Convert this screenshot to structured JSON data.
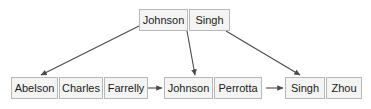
{
  "diagram": {
    "type": "hash-table-chaining-diagram",
    "root_node": {
      "name": "root-bucket-node",
      "x": 139,
      "y": 9,
      "cells": [
        {
          "label": "Johnson",
          "width": 49
        },
        {
          "label": "Singh",
          "width": 41
        }
      ]
    },
    "chain_nodes": [
      {
        "name": "chain-node-1",
        "x": 11,
        "y": 77,
        "cells": [
          {
            "label": "Abelson",
            "width": 47
          },
          {
            "label": "Charles",
            "width": 44
          },
          {
            "label": "Farrelly",
            "width": 44
          }
        ]
      },
      {
        "name": "chain-node-2",
        "x": 164,
        "y": 77,
        "cells": [
          {
            "label": "Johnson",
            "width": 49
          },
          {
            "label": "Perrotta",
            "width": 48
          }
        ]
      },
      {
        "name": "chain-node-3",
        "x": 285,
        "y": 77,
        "cells": [
          {
            "label": "Singh",
            "width": 40
          },
          {
            "label": "Zhou",
            "width": 36
          }
        ]
      }
    ],
    "arrows": [
      {
        "name": "arrow-root-to-chain-1",
        "x1": 141,
        "y1": 25,
        "x2": 41,
        "y2": 75
      },
      {
        "name": "arrow-root-to-chain-2",
        "x1": 187,
        "y1": 31,
        "x2": 195,
        "y2": 75
      },
      {
        "name": "arrow-root-to-chain-3",
        "x1": 226,
        "y1": 31,
        "x2": 300,
        "y2": 75
      },
      {
        "name": "arrow-chain-1-to-chain-2",
        "x1": 146,
        "y1": 88,
        "x2": 162,
        "y2": 88
      },
      {
        "name": "arrow-chain-2-to-chain-3",
        "x1": 266,
        "y1": 88,
        "x2": 283,
        "y2": 88
      }
    ],
    "colors": {
      "cell_fill": "#f4f4f4",
      "cell_border": "#b8b8b8",
      "text": "#1a1a1a",
      "arrow": "#4a4a4a",
      "background": "#ffffff"
    }
  }
}
